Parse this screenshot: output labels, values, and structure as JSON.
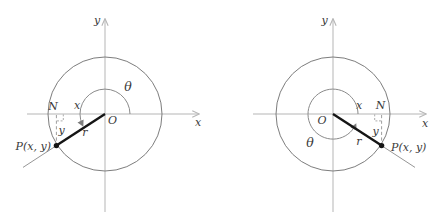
{
  "panels": [
    {
      "name": "left-diagram",
      "terminal_quadrant": "third",
      "labels": {
        "y_axis": "y",
        "x_axis": "x",
        "theta": "θ",
        "x_distance": "x",
        "y_distance": "y",
        "radius": "r",
        "origin": "O",
        "foot": "N",
        "point": "P(x, y)"
      }
    },
    {
      "name": "right-diagram",
      "terminal_quadrant": "fourth",
      "labels": {
        "y_axis": "y",
        "x_axis": "x",
        "theta": "θ",
        "x_distance": "x",
        "y_distance": "y",
        "radius": "r",
        "origin": "O",
        "foot": "N",
        "point": "P(x, y)"
      }
    }
  ],
  "colors": {
    "axis": "#b5b5b5",
    "circle": "#7d7d7d",
    "angle_arc": "#8a8a8a",
    "radius_segment": "#151515",
    "dashed": "#9e9e9e",
    "text": "#3a3a3a",
    "background": "#ffffff"
  }
}
